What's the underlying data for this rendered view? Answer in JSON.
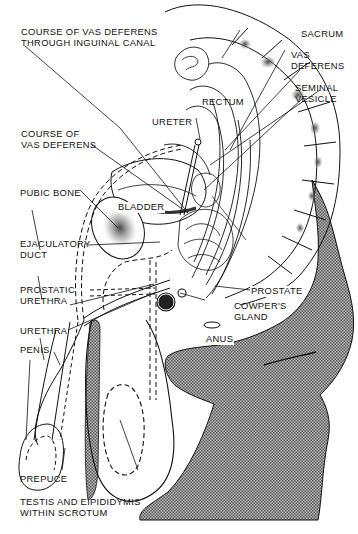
{
  "figure": {
    "colors": {
      "ink": "#111111",
      "shade": "#8a8a8a",
      "paper": "#ffffff"
    }
  },
  "labels": {
    "vas_inguinal": "COURSE OF VAS DEFERENS\nTHROUGH INGUINAL CANAL",
    "sacrum": "SACRUM",
    "vas_deferens": "VAS\nDEFERENS",
    "seminal_vesicle": "SEMINAL\nVESICLE",
    "rectum": "RECTUM",
    "ureter": "URETER",
    "course_vas": "COURSE OF\nVAS DEFERENS",
    "pubic_bone": "PUBIC BONE",
    "bladder": "BLADDER",
    "ejaculatory_duct": "EJACULATORY\nDUCT",
    "prostate": "PROSTATE",
    "prostatic_urethra": "PROSTATIC\nURETHRA",
    "cowpers_gland": "COWPER'S\nGLAND",
    "urethra": "URETHRA",
    "anus": "ANUS",
    "penis": "PENIS",
    "prepuce": "PREPUCE",
    "testis": "TESTIS AND EIPIDIDYMIS\nWITHIN SCROTUM"
  }
}
